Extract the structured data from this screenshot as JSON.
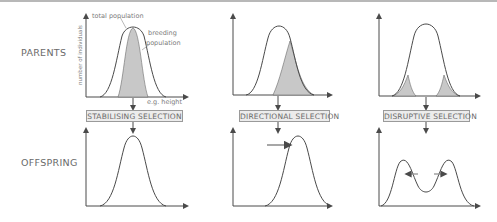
{
  "rows": {
    "parents_label": "PARENTS",
    "offspring_label": "OFFSPRING"
  },
  "annotations": {
    "total_population": "total population",
    "breeding_line1": "breeding",
    "breeding_line2": "population",
    "y_axis": "number of individuals",
    "x_axis": "e.g. height"
  },
  "panels": [
    {
      "selection_label": "STABILISING SELECTION",
      "type": "stabilising"
    },
    {
      "selection_label": "DIRECTIONAL SELECTION",
      "type": "directional"
    },
    {
      "selection_label": "DISRUPTIVE SELECTION",
      "type": "disruptive"
    }
  ],
  "colors": {
    "curve": "#4a4a4a",
    "shading": "#c8c8c8",
    "box_fill": "#ececec",
    "box_border": "#9a9a9a",
    "text": "#6a6a6a"
  }
}
